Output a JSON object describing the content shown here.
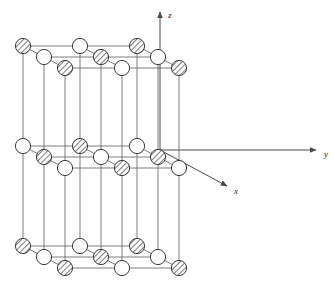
{
  "figure": {
    "background_color": "#ffffff",
    "line_color": "#6e6e6e",
    "atom_outline_color": "#3a3a3a",
    "hatch_color": "#5a5a5a",
    "open_fill": "#ffffff",
    "axis_color": "#4a4a4a",
    "atom_radius": 7.6
  },
  "axes": [
    {
      "name": "z-axis",
      "label": "z",
      "label_x": 168,
      "label_y": 18,
      "x1": 160,
      "y1": 150,
      "x2": 160,
      "y2": 12
    },
    {
      "name": "y-axis",
      "label": "y",
      "label_x": 324,
      "label_y": 157,
      "x1": 160,
      "y1": 150,
      "x2": 316,
      "y2": 150
    },
    {
      "name": "x-axis",
      "label": "x",
      "label_x": 234,
      "label_y": 194,
      "x1": 160,
      "y1": 150,
      "x2": 227,
      "y2": 186
    }
  ],
  "lattice": {
    "origin_x": 23,
    "origin_y": 46,
    "step_x": 57.0,
    "layer_step_y": 100.0,
    "depth_dx": 21.0,
    "depth_dy": 11.0,
    "grid_n": 3,
    "layers": 3,
    "atom_kinds": [
      "hatched",
      "open"
    ],
    "layer_parity": [
      0,
      1,
      0
    ],
    "legend": {
      "hatched_species": "ion A",
      "open_species": "ion B"
    }
  },
  "layer_labels": [
    "top-layer",
    "middle-layer",
    "bottom-layer"
  ]
}
